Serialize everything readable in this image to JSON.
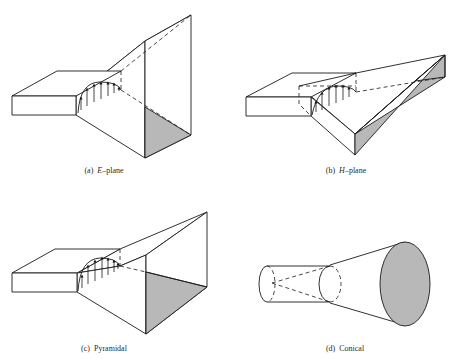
{
  "figure": {
    "panels": [
      {
        "id": "a",
        "letter": "(a)",
        "label_italic": "E",
        "label_rest": "–plane",
        "fill_color": "#b8b8b8"
      },
      {
        "id": "b",
        "letter": "(b)",
        "label_italic": "H",
        "label_rest": "–plane",
        "fill_color": "#b8b8b8"
      },
      {
        "id": "c",
        "letter": "(c)",
        "label_italic": "",
        "label_rest": "Pyramidal",
        "fill_color": "#b8b8b8"
      },
      {
        "id": "d",
        "letter": "(d)",
        "label_italic": "",
        "label_rest": "Conical",
        "fill_color": "#b8b8b8"
      }
    ]
  }
}
